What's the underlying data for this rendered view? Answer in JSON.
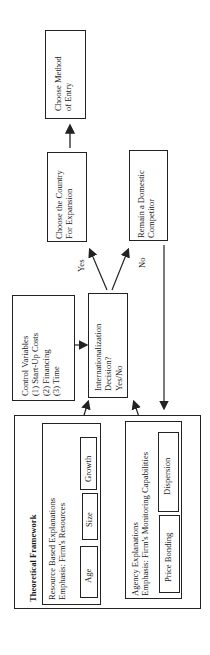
{
  "diagram": {
    "orientation": "rotated-90-ccw",
    "nodes": {
      "choose_method": {
        "lines": [
          "Choose Method",
          "of Entry"
        ]
      },
      "choose_country": {
        "lines": [
          "Choose the Country",
          "For Expansion"
        ]
      },
      "remain_domestic": {
        "lines": [
          "Remain a Domestic",
          "Competitor"
        ]
      },
      "control_variables": {
        "lines": [
          "Control Variables",
          "(1) Start-Up Costs",
          "(2) Financing",
          "(3) Time"
        ]
      },
      "decision": {
        "lines": [
          "Internationalization",
          "Decision?",
          "Yes/No"
        ]
      },
      "framework": {
        "title": "Theoretical Framework",
        "resource": {
          "lines": [
            "Resource Based Explanations",
            "Emphasis: Firm's Resources"
          ],
          "items": [
            "Age",
            "Size",
            "Growth"
          ]
        },
        "agency": {
          "lines": [
            "Agency Explanations",
            "Emphasis: Firm's Monitoring Capabilities"
          ],
          "items": [
            "Price Bonding",
            "Dispersion"
          ]
        }
      }
    },
    "edge_labels": {
      "yes": "Yes",
      "no": "No"
    },
    "edges": [
      {
        "from": "choose_country",
        "to": "choose_method"
      },
      {
        "from": "decision",
        "to": "choose_country",
        "label": "Yes"
      },
      {
        "from": "decision",
        "to": "remain_domestic",
        "label": "No"
      },
      {
        "from": "control_variables",
        "to": "decision"
      },
      {
        "from": "remain_domestic",
        "to": "framework"
      },
      {
        "from": "framework.resource",
        "to": "decision"
      },
      {
        "from": "framework.agency",
        "to": "decision"
      }
    ],
    "colors": {
      "line": "#222222",
      "background": "#ffffff"
    }
  }
}
